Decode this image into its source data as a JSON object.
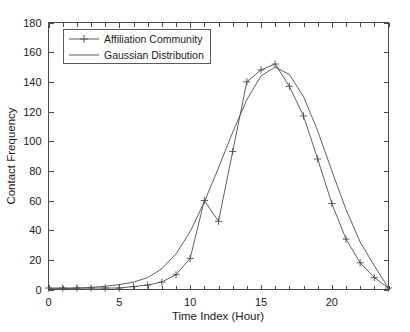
{
  "chart_data": {
    "type": "line",
    "title": "",
    "xlabel": "Time Index (Hour)",
    "ylabel": "Contact Frequency",
    "xlim": [
      0,
      24
    ],
    "ylim": [
      0,
      180
    ],
    "xticks": [
      0,
      5,
      10,
      15,
      20
    ],
    "xticks_labels": [
      "0",
      "5",
      "10",
      "15",
      "20"
    ],
    "xticks_minor": [
      1,
      2,
      3,
      4,
      6,
      7,
      8,
      9,
      11,
      12,
      13,
      14,
      16,
      17,
      18,
      19,
      21,
      22,
      23,
      24
    ],
    "yticks": [
      0,
      20,
      40,
      60,
      80,
      100,
      120,
      140,
      160,
      180
    ],
    "yticks_labels": [
      "0",
      "20",
      "40",
      "60",
      "80",
      "100",
      "120",
      "140",
      "160",
      "180"
    ],
    "grid": false,
    "legend_position": "top-left",
    "x": [
      0,
      1,
      2,
      3,
      4,
      5,
      6,
      7,
      8,
      9,
      10,
      11,
      12,
      13,
      14,
      15,
      16,
      17,
      18,
      19,
      20,
      21,
      22,
      23,
      24
    ],
    "series": [
      {
        "name": "Affiliation Community",
        "marker": "plus",
        "color": "#4d4d4d",
        "values": [
          1,
          1,
          1,
          1,
          1,
          1,
          2,
          3,
          5,
          10,
          21,
          60,
          46,
          93,
          140,
          148,
          152,
          137,
          117,
          88,
          58,
          34,
          18,
          8,
          1
        ]
      },
      {
        "name": "Gaussian Distribution",
        "marker": "none",
        "color": "#4d4d4d",
        "values": [
          0.4,
          0.6,
          0.9,
          1.4,
          2.2,
          3.3,
          5.0,
          8.0,
          14,
          24,
          39,
          59,
          82,
          106,
          128,
          144,
          150,
          145,
          130,
          107,
          80,
          54,
          32,
          16,
          1
        ]
      }
    ],
    "annotations": []
  },
  "legend": {
    "entries": [
      {
        "label": "Affiliation Community"
      },
      {
        "label": "Gaussian Distribution"
      }
    ]
  },
  "axes": {
    "x_title": "Time Index (Hour)",
    "y_title": "Contact Frequency"
  }
}
